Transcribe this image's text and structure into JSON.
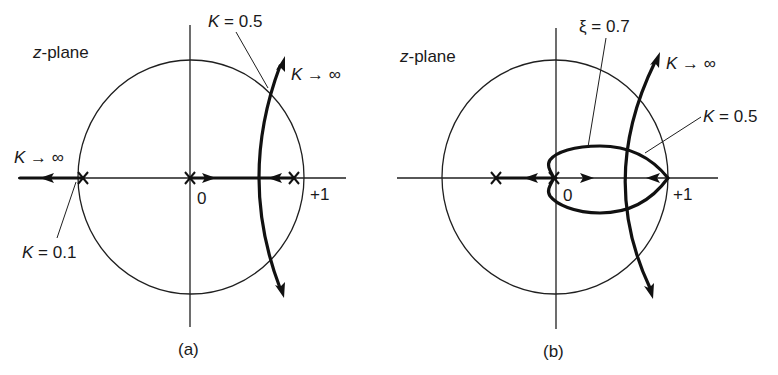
{
  "figure": {
    "panels": [
      {
        "id": "a",
        "caption": "(a)",
        "plane_label_var": "z",
        "plane_label_rest": "-plane",
        "origin_label": "0",
        "unit_label": "+1",
        "annotations": {
          "k_half": "K = 0.5",
          "k_inf_upper": "K → ∞",
          "k_inf_left": "K → ∞",
          "k_tenth": "K = 0.1"
        }
      },
      {
        "id": "b",
        "caption": "(b)",
        "plane_label_var": "z",
        "plane_label_rest": "-plane",
        "origin_label": "0",
        "unit_label": "+1",
        "annotations": {
          "xi": "ξ = 0.7",
          "k_inf_upper": "K → ∞",
          "k_half": "K = 0.5"
        }
      }
    ],
    "colors": {
      "ink": "#111111",
      "background": "#ffffff"
    }
  }
}
